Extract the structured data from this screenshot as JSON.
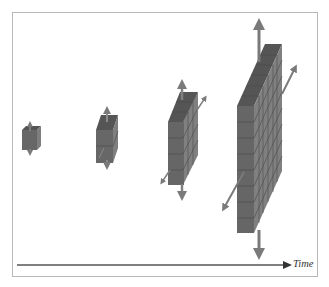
{
  "diagram": {
    "axis_label": "Time",
    "colors": {
      "front": "#6a6a6a",
      "top": "#555555",
      "side": "#8a8a8a",
      "grid": "#4a4a4a",
      "arrow": "#7a7a7a",
      "axis": "#555555",
      "frame": "#b8b8b8"
    },
    "stages": [
      {
        "name": "cube",
        "cols": 1,
        "rows": 1,
        "depth": 1
      },
      {
        "name": "column",
        "cols": 1,
        "rows": 2,
        "depth": 1
      },
      {
        "name": "slab",
        "cols": 1,
        "rows": 4,
        "depth": 3
      },
      {
        "name": "wall",
        "cols": 1,
        "rows": 9,
        "depth": 6
      }
    ]
  }
}
